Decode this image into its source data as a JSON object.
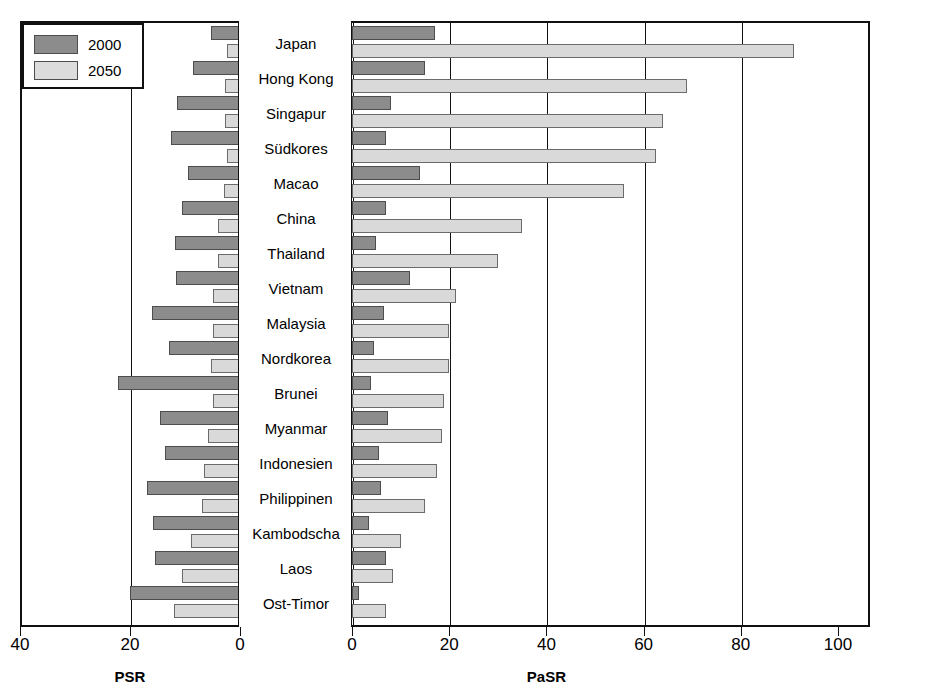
{
  "legend": {
    "items": [
      {
        "label": "2000",
        "color": "#8c8c8c"
      },
      {
        "label": "2050",
        "color": "#dcdcdc"
      }
    ]
  },
  "axes": {
    "left": {
      "title": "PSR",
      "ticks": [
        "40",
        "20",
        "0"
      ],
      "tick_values": [
        40,
        20,
        0
      ],
      "range": [
        40,
        0
      ]
    },
    "right": {
      "title": "PaSR",
      "ticks": [
        "0",
        "20",
        "40",
        "60",
        "80",
        "100"
      ],
      "tick_values": [
        0,
        20,
        40,
        60,
        80,
        100
      ],
      "range": [
        0,
        100
      ]
    }
  },
  "chart_data": {
    "type": "bar",
    "title": "",
    "subtitle": "",
    "orientation": "horizontal",
    "layout": "butterfly / back-to-back paired bar chart",
    "xlabel_left": "PSR",
    "xlabel_right": "PaSR",
    "ylabel": "",
    "grid": true,
    "legend_position": "top-left",
    "xlim_left": [
      40,
      0
    ],
    "xlim_right": [
      0,
      100
    ],
    "categories": [
      "Japan",
      "Hong Kong",
      "Singapur",
      "Südkores",
      "Macao",
      "China",
      "Thailand",
      "Vietnam",
      "Malaysia",
      "Nordkorea",
      "Brunei",
      "Myanmar",
      "Indonesien",
      "Philippinen",
      "Kambodscha",
      "Laos",
      "Ost-Timor"
    ],
    "series": [
      {
        "name": "PSR 2000",
        "panel": "left",
        "year": "2000",
        "color": "#8c8c8c",
        "values": [
          5.3,
          8.6,
          11.4,
          12.5,
          9.5,
          10.5,
          11.8,
          11.6,
          16.0,
          13.0,
          22.2,
          14.5,
          13.6,
          17.0,
          15.8,
          15.5,
          20.0
        ]
      },
      {
        "name": "PSR 2050",
        "panel": "left",
        "year": "2050",
        "color": "#dcdcdc",
        "values": [
          2.4,
          2.8,
          2.8,
          2.4,
          3.0,
          4.0,
          4.0,
          5.0,
          5.0,
          5.2,
          5.0,
          5.8,
          6.5,
          7.0,
          9.0,
          10.5,
          12.0
        ]
      },
      {
        "name": "PaSR 2000",
        "panel": "right",
        "year": "2000",
        "color": "#8c8c8c",
        "values": [
          17.0,
          15.0,
          8.0,
          7.0,
          14.0,
          7.0,
          5.0,
          12.0,
          6.5,
          4.5,
          4.0,
          7.5,
          5.5,
          6.0,
          3.5,
          7.0,
          1.5
        ]
      },
      {
        "name": "PaSR 2050",
        "panel": "right",
        "year": "2050",
        "color": "#dcdcdc",
        "values": [
          91.0,
          69.0,
          64.0,
          62.5,
          56.0,
          35.0,
          30.0,
          21.5,
          20.0,
          20.0,
          19.0,
          18.5,
          17.5,
          15.0,
          10.0,
          8.5,
          7.0
        ]
      }
    ]
  },
  "geometry": {
    "plot_left": 20,
    "plot_top": 21,
    "plot_width": 850,
    "plot_height": 606,
    "label_col_left": 238,
    "label_col_width": 114,
    "psr_zero_x": 240,
    "psr_px_per_unit": 5.5,
    "pasr_zero_x": 352,
    "pasr_px_per_unit": 4.86,
    "row_pitch": 35.0,
    "row_first_center": 44.0,
    "bar_height": 14,
    "bar_offset": 7
  }
}
